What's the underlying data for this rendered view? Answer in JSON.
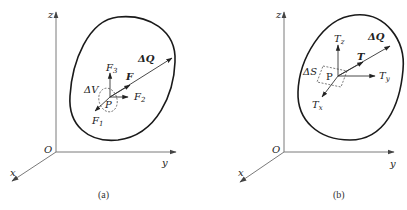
{
  "panels": [
    {
      "id": "a",
      "caption": "(a)",
      "axes": {
        "origin": "O",
        "x": "x",
        "y": "y",
        "z": "z"
      },
      "point": "P",
      "element": "ΔV",
      "resultant": "ΔQ",
      "force": "F",
      "components": [
        {
          "base": "F",
          "sub": "1"
        },
        {
          "base": "F",
          "sub": "2"
        },
        {
          "base": "F",
          "sub": "3"
        }
      ]
    },
    {
      "id": "b",
      "caption": "(b)",
      "axes": {
        "origin": "O",
        "x": "x",
        "y": "y",
        "z": "z"
      },
      "point": "P",
      "element": "ΔS",
      "resultant": "ΔQ",
      "force": "T",
      "components": [
        {
          "base": "T",
          "sub": "x"
        },
        {
          "base": "T",
          "sub": "y"
        },
        {
          "base": "T",
          "sub": "z"
        }
      ]
    }
  ]
}
